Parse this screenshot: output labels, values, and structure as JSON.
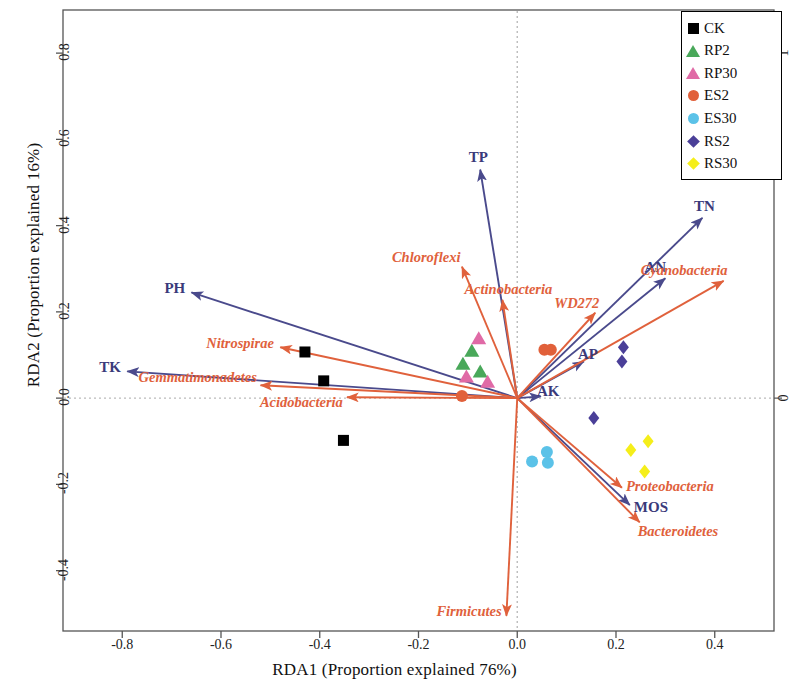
{
  "chart_data": {
    "type": "scatter",
    "title": "",
    "xlabel": "RDA1 (Proportion explained 76%)",
    "ylabel": "RDA2 (Proportion explained 16%)",
    "xlim": [
      -0.92,
      0.52
    ],
    "ylim": [
      -0.54,
      0.9
    ],
    "xticks": [
      -0.8,
      -0.6,
      -0.4,
      -0.2,
      0.0,
      0.2,
      0.4
    ],
    "xtick_labels": [
      "-0.8",
      "-0.6",
      "-0.4",
      "-0.2",
      "0.0",
      "0.2",
      "0.4"
    ],
    "yticks": [
      -0.4,
      -0.2,
      0.0,
      0.2,
      0.4,
      0.6,
      0.8
    ],
    "ytick_labels": [
      "-0.4",
      "-0.2",
      "0.0",
      "0.2",
      "0.4",
      "0.6",
      "0.8"
    ],
    "grid": "zero-dotted-crosshair",
    "legend_position": "top-right",
    "groups": [
      {
        "name": "CK",
        "marker": "square",
        "color": "#000000",
        "points": [
          [
            -0.43,
            0.107
          ],
          [
            -0.392,
            0.04
          ],
          [
            -0.352,
            -0.098
          ]
        ]
      },
      {
        "name": "RP2",
        "marker": "triangle",
        "color": "#49a85a",
        "points": [
          [
            -0.11,
            0.08
          ],
          [
            -0.092,
            0.11
          ],
          [
            -0.075,
            0.062
          ]
        ]
      },
      {
        "name": "RP30",
        "marker": "triangle",
        "color": "#e06aa6",
        "points": [
          [
            -0.103,
            0.05
          ],
          [
            -0.078,
            0.139
          ],
          [
            -0.06,
            0.038
          ]
        ]
      },
      {
        "name": "ES2",
        "marker": "circle",
        "color": "#e1603a",
        "points": [
          [
            0.055,
            0.112
          ],
          [
            0.068,
            0.112
          ],
          [
            -0.112,
            0.005
          ]
        ]
      },
      {
        "name": "ES30",
        "marker": "circle",
        "color": "#5bc2e8",
        "points": [
          [
            0.03,
            -0.147
          ],
          [
            0.06,
            -0.125
          ],
          [
            0.062,
            -0.15
          ]
        ]
      },
      {
        "name": "RS2",
        "marker": "diamond",
        "color": "#4a3f98",
        "points": [
          [
            0.215,
            0.118
          ],
          [
            0.212,
            0.085
          ],
          [
            0.155,
            -0.046
          ]
        ]
      },
      {
        "name": "RS30",
        "marker": "diamond",
        "color": "#f5ee1a",
        "points": [
          [
            0.23,
            -0.12
          ],
          [
            0.265,
            -0.1
          ],
          [
            0.258,
            -0.17
          ]
        ]
      }
    ],
    "env_vectors": [
      {
        "label": "PH",
        "x": -0.66,
        "y": 0.245
      },
      {
        "label": "TK",
        "x": -0.79,
        "y": 0.062
      },
      {
        "label": "TP",
        "x": -0.075,
        "y": 0.53
      },
      {
        "label": "AN",
        "x": 0.3,
        "y": 0.278
      },
      {
        "label": "TN",
        "x": 0.375,
        "y": 0.418
      },
      {
        "label": "AP",
        "x": 0.135,
        "y": 0.085
      },
      {
        "label": "AK",
        "x": 0.048,
        "y": 0.004
      },
      {
        "label": "MOS",
        "x": 0.228,
        "y": -0.248
      }
    ],
    "species_vectors": [
      {
        "label": "Nitrospirae",
        "x": -0.48,
        "y": 0.118
      },
      {
        "label": "Gemmatimonadetes",
        "x": -0.52,
        "y": 0.03
      },
      {
        "label": "Acidobacteria",
        "x": -0.345,
        "y": 0.002
      },
      {
        "label": "Chloroflexi",
        "x": -0.112,
        "y": 0.305
      },
      {
        "label": "Actinobacteria",
        "x": -0.03,
        "y": 0.228
      },
      {
        "label": "WD272",
        "x": 0.158,
        "y": 0.198
      },
      {
        "label": "Cyanobacteria",
        "x": 0.418,
        "y": 0.272
      },
      {
        "label": "Proteobacteria",
        "x": 0.212,
        "y": -0.208
      },
      {
        "label": "Bacteroidetes",
        "x": 0.248,
        "y": -0.288
      },
      {
        "label": "Firmicutes",
        "x": -0.022,
        "y": -0.505
      }
    ],
    "colors": {
      "env_vector": "#4a4a8c",
      "species_vector": "#e0613c",
      "frame": "#555555",
      "zero_line": "#bbbbbb"
    }
  },
  "legend": {
    "items": [
      {
        "label": "CK",
        "marker": "square",
        "color": "#000000"
      },
      {
        "label": "RP2",
        "marker": "triangle",
        "color": "#49a85a"
      },
      {
        "label": "RP30",
        "marker": "triangle",
        "color": "#e06aa6"
      },
      {
        "label": "ES2",
        "marker": "circle",
        "color": "#e1603a"
      },
      {
        "label": "ES30",
        "marker": "circle",
        "color": "#5bc2e8"
      },
      {
        "label": "RS2",
        "marker": "diamond",
        "color": "#4a3f98"
      },
      {
        "label": "RS30",
        "marker": "diamond",
        "color": "#f5ee1a"
      }
    ]
  }
}
